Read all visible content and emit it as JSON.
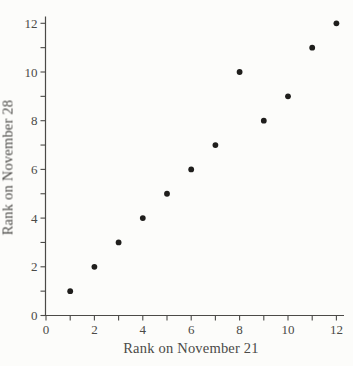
{
  "figure": {
    "background": "#fcfcfa"
  },
  "chart_data": {
    "type": "scatter",
    "title": "",
    "xlabel": "Rank on November 21",
    "ylabel": "Rank on November 28",
    "xlim": [
      0,
      12
    ],
    "ylim": [
      0,
      12
    ],
    "x_tick_interval": 1,
    "y_tick_interval": 1,
    "x_tick_label_values": [
      0,
      2,
      4,
      6,
      8,
      10,
      12
    ],
    "y_tick_label_values": [
      0,
      2,
      4,
      6,
      8,
      10,
      12
    ],
    "grid": false,
    "legend": false,
    "marker": "filled-circle",
    "points": [
      [
        1,
        1
      ],
      [
        2,
        2
      ],
      [
        3,
        3
      ],
      [
        4,
        4
      ],
      [
        5,
        5
      ],
      [
        6,
        6
      ],
      [
        7,
        7
      ],
      [
        8,
        10
      ],
      [
        9,
        8
      ],
      [
        10,
        9
      ],
      [
        11,
        11
      ],
      [
        12,
        12
      ]
    ],
    "colors": {
      "ink": "#4b4a47",
      "marker": "#1f1e1c",
      "background": "#fcfcfa"
    }
  }
}
